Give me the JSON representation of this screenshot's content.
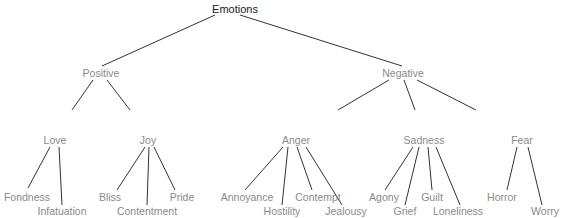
{
  "diagram": {
    "type": "tree",
    "line_color": "#333333",
    "root_color": "#1a1a1a",
    "label_color": "#8a8a8a",
    "nodes": [
      {
        "id": "emotions",
        "label": "Emotions",
        "x": 235,
        "y": 9,
        "level": 0
      },
      {
        "id": "positive",
        "label": "Positive",
        "x": 101,
        "y": 73,
        "level": 1
      },
      {
        "id": "negative",
        "label": "Negative",
        "x": 403,
        "y": 73,
        "level": 1
      },
      {
        "id": "love",
        "label": "Love",
        "x": 55,
        "y": 140,
        "level": 2
      },
      {
        "id": "joy",
        "label": "Joy",
        "x": 148,
        "y": 140,
        "level": 2
      },
      {
        "id": "anger",
        "label": "Anger",
        "x": 296,
        "y": 140,
        "level": 2
      },
      {
        "id": "sadness",
        "label": "Sadness",
        "x": 424,
        "y": 140,
        "level": 2
      },
      {
        "id": "fear",
        "label": "Fear",
        "x": 522,
        "y": 140,
        "level": 2
      },
      {
        "id": "fondness",
        "label": "Fondness",
        "x": 27,
        "y": 197,
        "level": 3
      },
      {
        "id": "infatuation",
        "label": "Infatuation",
        "x": 62,
        "y": 211,
        "level": 3
      },
      {
        "id": "bliss",
        "label": "Bliss",
        "x": 110,
        "y": 197,
        "level": 3
      },
      {
        "id": "contentment",
        "label": "Contentment",
        "x": 147,
        "y": 211,
        "level": 3
      },
      {
        "id": "pride",
        "label": "Pride",
        "x": 182,
        "y": 197,
        "level": 3
      },
      {
        "id": "annoyance",
        "label": "Annoyance",
        "x": 247,
        "y": 197,
        "level": 3
      },
      {
        "id": "hostility",
        "label": "Hostility",
        "x": 282,
        "y": 211,
        "level": 3
      },
      {
        "id": "contempt",
        "label": "Contempt",
        "x": 318,
        "y": 197,
        "level": 3
      },
      {
        "id": "jealousy",
        "label": "Jealousy",
        "x": 346,
        "y": 211,
        "level": 3
      },
      {
        "id": "agony",
        "label": "Agony",
        "x": 384,
        "y": 197,
        "level": 3
      },
      {
        "id": "grief",
        "label": "Grief",
        "x": 405,
        "y": 211,
        "level": 3
      },
      {
        "id": "guilt",
        "label": "Guilt",
        "x": 432,
        "y": 197,
        "level": 3
      },
      {
        "id": "loneliness",
        "label": "Loneliness",
        "x": 458,
        "y": 211,
        "level": 3
      },
      {
        "id": "horror",
        "label": "Horror",
        "x": 502,
        "y": 197,
        "level": 3
      },
      {
        "id": "worry",
        "label": "Worry",
        "x": 545,
        "y": 211,
        "level": 3
      }
    ],
    "edges": [
      [
        215,
        15,
        102,
        66
      ],
      [
        240,
        15,
        402,
        66
      ],
      [
        93,
        80,
        72,
        110
      ],
      [
        107,
        80,
        130,
        110
      ],
      [
        389,
        80,
        338,
        110
      ],
      [
        404,
        80,
        415,
        110
      ],
      [
        417,
        80,
        476,
        110
      ],
      [
        50,
        147,
        28,
        188
      ],
      [
        59,
        147,
        62,
        205
      ],
      [
        145,
        147,
        117,
        190
      ],
      [
        149,
        147,
        147,
        205
      ],
      [
        154,
        147,
        175,
        190
      ],
      [
        283,
        147,
        245,
        190
      ],
      [
        288,
        147,
        282,
        205
      ],
      [
        297,
        147,
        312,
        190
      ],
      [
        306,
        147,
        342,
        205
      ],
      [
        413,
        147,
        385,
        190
      ],
      [
        419,
        147,
        405,
        205
      ],
      [
        428,
        147,
        432,
        190
      ],
      [
        436,
        147,
        460,
        205
      ],
      [
        517,
        147,
        507,
        190
      ],
      [
        528,
        147,
        542,
        205
      ]
    ]
  }
}
